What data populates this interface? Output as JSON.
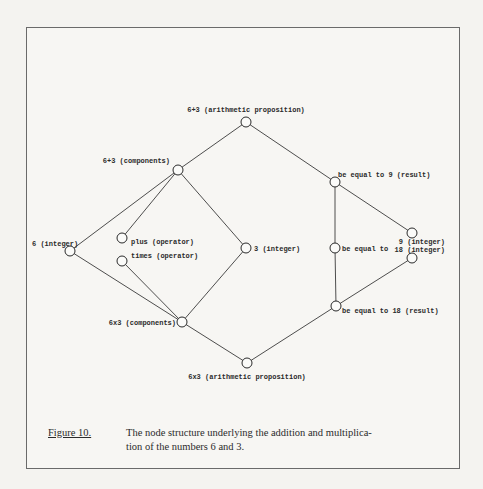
{
  "figure": {
    "label": "Figure 10.",
    "caption_line1": "The node structure underlying the addition and multiplica-",
    "caption_line2": "tion of the numbers 6 and 3."
  },
  "nodes": {
    "add_prop": {
      "label": "6+3 (arithmetic proposition)",
      "x": 246,
      "y": 122
    },
    "add_comp": {
      "label": "6+3 (components)",
      "x": 178,
      "y": 170
    },
    "six": {
      "label": "6 (integer)",
      "x": 70,
      "y": 251
    },
    "plus": {
      "label": "plus (operator)",
      "x": 122,
      "y": 238
    },
    "times": {
      "label": "times (operator)",
      "x": 122,
      "y": 261
    },
    "three": {
      "label": "3 (integer)",
      "x": 246,
      "y": 248
    },
    "mul_comp": {
      "label": "6x3 (components)",
      "x": 182,
      "y": 322
    },
    "mul_prop": {
      "label": "6x3 (arithmetic proposition)",
      "x": 247,
      "y": 363
    },
    "eq9": {
      "label": "be equal to 9 (result)",
      "x": 335,
      "y": 182
    },
    "eq": {
      "label": "be equal to",
      "x": 335,
      "y": 248
    },
    "eq18": {
      "label": "be equal to 18 (result)",
      "x": 336,
      "y": 306
    },
    "nine": {
      "label": "9 (integer)",
      "x": 412,
      "y": 233
    },
    "eighteen": {
      "label": "18 (integer)",
      "x": 412,
      "y": 258
    }
  },
  "edges": [
    [
      "add_prop",
      "add_comp"
    ],
    [
      "add_prop",
      "eq9"
    ],
    [
      "add_comp",
      "six"
    ],
    [
      "add_comp",
      "plus"
    ],
    [
      "add_comp",
      "three"
    ],
    [
      "six",
      "mul_comp"
    ],
    [
      "times",
      "mul_comp"
    ],
    [
      "three",
      "mul_comp"
    ],
    [
      "mul_comp",
      "mul_prop"
    ],
    [
      "mul_prop",
      "eq18"
    ],
    [
      "eq9",
      "eq"
    ],
    [
      "eq",
      "eq18"
    ],
    [
      "eq9",
      "nine"
    ],
    [
      "eq18",
      "eighteen"
    ]
  ],
  "colors": {
    "ink": "#2a2a2a",
    "paper": "#f7f6f3",
    "frame": "#6a6a6a"
  }
}
